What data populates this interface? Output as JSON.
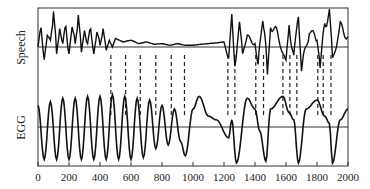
{
  "chart_data": {
    "type": "line",
    "title": "",
    "xlabel": "",
    "xlim": [
      0,
      2000
    ],
    "x_ticks": [
      "0",
      "200",
      "400",
      "600",
      "800",
      "1000",
      "1200",
      "1400",
      "1600",
      "1800",
      "2000"
    ],
    "grid": false,
    "legend": "none",
    "panels": [
      {
        "name": "Speech",
        "ylabel": "Speech",
        "description": "Speech waveform: periodic voiced pulses 0-450, low-amplitude damped oscillation 450-1200, noisy high-amplitude irregular segment 1200-2000"
      },
      {
        "name": "EGG",
        "ylabel": "EGG",
        "description": "Electroglottograph signal: regular ~80-unit period oscillation 0-950, then slower irregular cycles with sharp minima near 1280, 1470, 1680, 1890"
      }
    ],
    "series": [
      {
        "name": "Speech",
        "x": [
          0,
          20,
          40,
          60,
          80,
          100,
          120,
          140,
          160,
          180,
          200,
          220,
          240,
          260,
          280,
          300,
          320,
          340,
          360,
          380,
          400,
          420,
          440,
          460,
          480,
          500,
          550,
          600,
          650,
          700,
          750,
          800,
          850,
          900,
          950,
          1000,
          1050,
          1100,
          1150,
          1200,
          1230,
          1250,
          1270,
          1300,
          1320,
          1350,
          1400,
          1420,
          1450,
          1480,
          1500,
          1550,
          1600,
          1620,
          1650,
          1680,
          1700,
          1750,
          1800,
          1820,
          1850,
          1880,
          1900,
          1950,
          2000
        ],
        "values": [
          0,
          0.7,
          -0.3,
          0.4,
          0.2,
          0.85,
          -0.2,
          0.5,
          0.1,
          0.8,
          -0.2,
          0.6,
          0.1,
          0.75,
          -0.15,
          0.5,
          0.1,
          0.7,
          -0.2,
          0.4,
          0.05,
          0.45,
          -0.1,
          0.2,
          0,
          0.25,
          0.15,
          0.2,
          0.1,
          0.15,
          0.08,
          0.1,
          0.05,
          0.1,
          0.05,
          0.05,
          0.08,
          0.1,
          0.12,
          0.15,
          -0.4,
          0.9,
          -0.5,
          0.6,
          -0.2,
          0.3,
          0.1,
          -0.6,
          1.0,
          -0.8,
          0.7,
          0.3,
          -0.5,
          0.6,
          -0.3,
          1.1,
          -0.7,
          0.5,
          0.2,
          -0.5,
          0.7,
          0.9,
          -0.4,
          0.6,
          0.3
        ]
      },
      {
        "name": "EGG",
        "x": [
          0,
          40,
          80,
          120,
          160,
          200,
          240,
          280,
          320,
          360,
          400,
          440,
          480,
          520,
          560,
          600,
          640,
          680,
          720,
          760,
          800,
          840,
          880,
          920,
          950,
          1000,
          1040,
          1100,
          1150,
          1230,
          1250,
          1280,
          1350,
          1400,
          1430,
          1470,
          1500,
          1580,
          1620,
          1650,
          1680,
          1730,
          1800,
          1850,
          1880,
          1900,
          1950,
          2000
        ],
        "values": [
          0.6,
          -0.9,
          0.7,
          -0.9,
          0.8,
          -0.9,
          0.8,
          -0.9,
          0.85,
          -0.9,
          0.85,
          -0.9,
          0.9,
          -0.9,
          0.85,
          -0.9,
          0.8,
          -0.85,
          0.75,
          -0.6,
          0.6,
          -0.5,
          0.5,
          -0.4,
          -0.8,
          0.5,
          0.85,
          0.3,
          0.2,
          -0.3,
          0.2,
          -1.0,
          0.8,
          0.5,
          -0.1,
          -0.95,
          0.5,
          0.85,
          0.4,
          0.2,
          -1.0,
          0.5,
          0.75,
          0.3,
          0.1,
          -1.0,
          0.2,
          0.5
        ]
      }
    ],
    "markers": {
      "type": "dashed-vertical",
      "x": [
        470,
        565,
        660,
        760,
        860,
        945,
        1225,
        1270,
        1405,
        1455,
        1580,
        1625,
        1670,
        1805,
        1840,
        1890
      ]
    }
  }
}
